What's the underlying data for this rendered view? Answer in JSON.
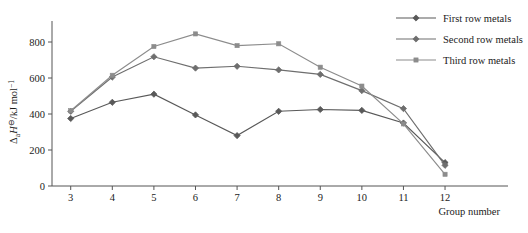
{
  "chart_data": {
    "type": "line",
    "title": "",
    "xlabel": "Group number",
    "ylabel": "ΔaH⊖/kJ mol⁻¹",
    "ylabel_parts": {
      "delta": "Δ",
      "sub": "a",
      "italic": "H",
      "super_standard": "⊖",
      "slash_units": "/kJ mol",
      "super_units": "−1"
    },
    "categories": [
      3,
      4,
      5,
      6,
      7,
      8,
      9,
      10,
      11,
      12
    ],
    "x": [
      3,
      4,
      5,
      6,
      7,
      8,
      9,
      10,
      11,
      12
    ],
    "xlim": [
      2.55,
      12.6
    ],
    "ylim": [
      0,
      900
    ],
    "xticks": [
      "3",
      "4",
      "5",
      "6",
      "7",
      "8",
      "9",
      "10",
      "11",
      "12"
    ],
    "yticks": [
      "0",
      "200",
      "400",
      "600",
      "800"
    ],
    "ytick_values": [
      0,
      200,
      400,
      600,
      800
    ],
    "grid": false,
    "legend_position": "right",
    "series": [
      {
        "name": "First row metals",
        "marker": "diamond",
        "color": "#595959",
        "values": [
          375,
          465,
          510,
          395,
          280,
          415,
          425,
          420,
          350,
          130
        ]
      },
      {
        "name": "Second row metals",
        "marker": "diamond",
        "color": "#6e6e6e",
        "values": [
          415,
          605,
          718,
          655,
          665,
          645,
          620,
          530,
          430,
          115
        ]
      },
      {
        "name": "Third row metals",
        "marker": "square",
        "color": "#8c8c8c",
        "values": [
          418,
          615,
          775,
          845,
          780,
          790,
          660,
          555,
          345,
          65
        ]
      }
    ]
  },
  "legend": {
    "items": [
      {
        "label": "First row metals"
      },
      {
        "label": "Second row metals"
      },
      {
        "label": "Third row metals"
      }
    ]
  }
}
